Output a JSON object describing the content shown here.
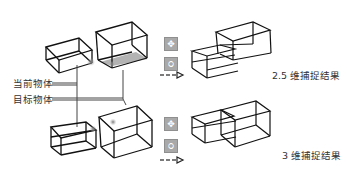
{
  "labels": {
    "current_object": "当前物体",
    "target_object": "目标物体",
    "result_2_5d": "2.5 维捕捉结果",
    "result_3d": "3 维捕捉结果"
  },
  "tools": {
    "move_icon": "✥",
    "snap_icon": "ଠ"
  },
  "colors": {
    "stroke": "#111111",
    "leader_line": "#444444",
    "shadow": "#9a9a9a",
    "button_bg": "#a9a9a9"
  }
}
